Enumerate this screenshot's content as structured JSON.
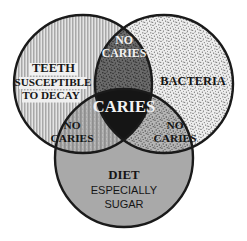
{
  "diagram": {
    "type": "venn-3-circle",
    "background_color": "#ffffff",
    "outline_color": "#1a1a1a",
    "circles": [
      {
        "id": "teeth",
        "label_lines": [
          "TEETH",
          "SUSCEPTIBLE",
          "TO DECAY"
        ],
        "texture": "vertical-stripes",
        "fill_color": "#b4b4b4",
        "cx": 83,
        "cy": 84,
        "r": 69
      },
      {
        "id": "bacteria",
        "label_lines": [
          "BACTERIA"
        ],
        "texture": "stipple",
        "fill_color": "#d8d8d8",
        "cx": 164,
        "cy": 84,
        "r": 69
      },
      {
        "id": "diet",
        "label_lines": [
          "DIET",
          "ESPECIALLY",
          "SUGAR"
        ],
        "texture": "solid",
        "fill_color": "#a9a9a9",
        "cx": 124,
        "cy": 158,
        "r": 69
      }
    ],
    "regions": [
      {
        "id": "top-lens",
        "label_lines": [
          "NO",
          "CARIES"
        ],
        "text_color": "#ffffff",
        "fill_color": "#6e6e6e",
        "cx": 124,
        "cy": 48
      },
      {
        "id": "left-lens",
        "label_lines": [
          "NO",
          "CARIES"
        ],
        "text_color": "#1a1a1a",
        "fill_color": "#a0a0a0",
        "cx": 72,
        "cy": 133
      },
      {
        "id": "right-lens",
        "label_lines": [
          "NO",
          "CARIES"
        ],
        "text_color": "#1a1a1a",
        "fill_color": "#9a9a9a",
        "cx": 174,
        "cy": 133
      },
      {
        "id": "center",
        "label_lines": [
          "CARIES"
        ],
        "text_color": "#ffffff",
        "fill_color": "#151515",
        "cx": 124,
        "cy": 108
      }
    ]
  },
  "labels": {
    "teeth_line1": "TEETH",
    "teeth_line2": "SUSCEPTIBLE",
    "teeth_line3": "TO DECAY",
    "bacteria": "BACTERIA",
    "diet_line1": "DIET",
    "diet_line2": "ESPECIALLY",
    "diet_line3": "SUGAR",
    "center": "CARIES",
    "no": "NO",
    "caries": "CARIES",
    "no_top": "NO",
    "caries_top": "CARIES",
    "no_left": "NO",
    "caries_left": "CARIES",
    "no_right": "NO",
    "caries_right": "CARIES"
  }
}
